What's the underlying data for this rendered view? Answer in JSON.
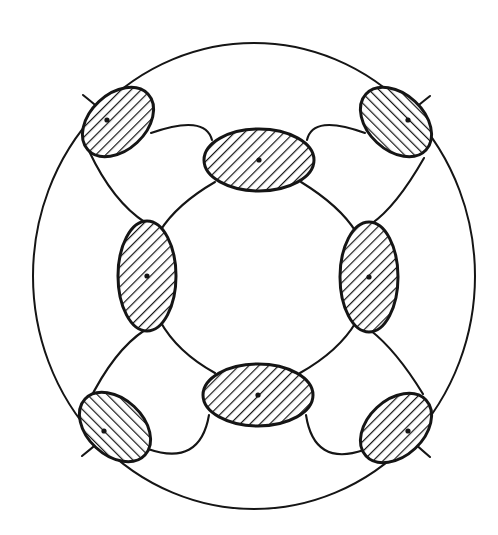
{
  "figure": {
    "background_color": "#ffffff",
    "line_color": "#151515",
    "hatch_color": "#151515",
    "fill_color": "#ffffff",
    "canvas": {
      "width": 498,
      "height": 535
    }
  },
  "chart_data": {
    "type": "diagram",
    "coordinate_system": "image pixels, origin top-left",
    "boundary": {
      "name": "outer-circle",
      "shape": "ellipse",
      "cx": 254,
      "cy": 276,
      "rx": 221,
      "ry": 233,
      "stroke_width": 2.0,
      "fill": "none"
    },
    "node_count": 8,
    "node_style": {
      "fill": "#ffffff",
      "stroke": "#151515",
      "stroke_width": 3.0,
      "hatch_pattern": "45-degree parallel lines",
      "hatch_spacing_px": 7,
      "hatch_line_width_px": 2.4,
      "center_marker": "small filled dot"
    },
    "nodes": [
      {
        "id": "node-top",
        "position": "top",
        "cx": 259,
        "cy": 160,
        "rx": 55,
        "ry": 31,
        "rotation_deg": 0,
        "hatch_angle_deg": 45,
        "dot": true
      },
      {
        "id": "node-right",
        "position": "right",
        "cx": 369,
        "cy": 277,
        "rx": 29,
        "ry": 55,
        "rotation_deg": 0,
        "hatch_angle_deg": 45,
        "dot": true
      },
      {
        "id": "node-bottom",
        "position": "bottom",
        "cx": 258,
        "cy": 395,
        "rx": 55,
        "ry": 31,
        "rotation_deg": 0,
        "hatch_angle_deg": 45,
        "dot": true
      },
      {
        "id": "node-left",
        "position": "left",
        "cx": 147,
        "cy": 276,
        "rx": 29,
        "ry": 55,
        "rotation_deg": 0,
        "hatch_angle_deg": 45,
        "dot": true
      },
      {
        "id": "node-top-left",
        "position": "top-left",
        "cx": 118,
        "cy": 122,
        "rx": 41,
        "ry": 28,
        "rotation_deg": -43,
        "hatch_angle_deg": 47,
        "dot": true
      },
      {
        "id": "node-top-right",
        "position": "top-right",
        "cx": 396,
        "cy": 122,
        "rx": 41,
        "ry": 28,
        "rotation_deg": 43,
        "hatch_angle_deg": -47,
        "dot": true
      },
      {
        "id": "node-bottom-left",
        "position": "bottom-left",
        "cx": 115,
        "cy": 427,
        "rx": 41,
        "ry": 28,
        "rotation_deg": 43,
        "hatch_angle_deg": -47,
        "dot": true
      },
      {
        "id": "node-bottom-right",
        "position": "bottom-right",
        "cx": 396,
        "cy": 428,
        "rx": 41,
        "ry": 28,
        "rotation_deg": -43,
        "hatch_angle_deg": 47,
        "dot": true
      }
    ],
    "connector_count": 16,
    "connector_style": {
      "stroke": "#151515",
      "stroke_width": 2.0,
      "fill": "none",
      "curvature": "gentle outward bow"
    },
    "connectors": [
      {
        "id": "arc-outer-tl-top",
        "ring": "outer",
        "from": "node-top-left",
        "to": "node-top",
        "path": "M 152 138 Q 205 118 210 142"
      },
      {
        "id": "arc-outer-top-tr",
        "ring": "outer",
        "from": "node-top",
        "to": "node-top-right",
        "path": "M 308 142 Q 315 118 363 137"
      },
      {
        "id": "arc-outer-tr-right",
        "ring": "outer",
        "from": "node-top-right",
        "to": "node-right",
        "path": "M 420 158 Q 394 205 368 222"
      },
      {
        "id": "arc-outer-right-br",
        "ring": "outer",
        "from": "node-right",
        "to": "node-bottom-right",
        "path": "M 369 332 Q 395 352 419 392"
      },
      {
        "id": "arc-outer-br-bottom",
        "ring": "outer",
        "from": "node-bottom-right",
        "to": "node-bottom",
        "path": "M 362 447 Q 315 470 308 413"
      },
      {
        "id": "arc-outer-bottom-bl",
        "ring": "outer",
        "from": "node-bottom",
        "to": "node-bottom-left",
        "path": "M 208 413 Q 200 470 150 446"
      },
      {
        "id": "arc-outer-bl-left",
        "ring": "outer",
        "from": "node-bottom-left",
        "to": "node-left",
        "path": "M 93 406 Q 115 350 147 331"
      },
      {
        "id": "arc-outer-left-tl",
        "ring": "outer",
        "from": "node-left",
        "to": "node-top-left",
        "path": "M 147 222 Q 113 200 92 148"
      },
      {
        "id": "arc-inner-top-right",
        "ring": "inner",
        "from": "node-top",
        "to": "node-right",
        "path": "M 300 184 Q 338 205 354 233"
      },
      {
        "id": "arc-inner-right-bottom",
        "ring": "inner",
        "from": "node-right",
        "to": "node-bottom",
        "path": "M 354 320 Q 337 350 300 371"
      },
      {
        "id": "arc-inner-bottom-left",
        "ring": "inner",
        "from": "node-bottom",
        "to": "node-left",
        "path": "M 216 371 Q 178 351 161 320"
      },
      {
        "id": "arc-inner-left-top",
        "ring": "inner",
        "from": "node-left",
        "to": "node-top",
        "path": "M 161 232 Q 178 204 216 184"
      },
      {
        "id": "arc-spoke-tl",
        "ring": "spoke",
        "from": "node-top-left",
        "to": "node-left",
        "path": "M 152 138 Q 176 158 213 143"
      },
      {
        "id": "arc-spoke-tr",
        "ring": "spoke",
        "from": "node-top-right",
        "to": "node-right",
        "path": "M 363 137 Q 384 157 420 158"
      },
      {
        "id": "arc-spoke-bl",
        "ring": "spoke",
        "from": "node-bottom-left",
        "to": "node-bottom",
        "path": "M 93 406 Q 122 420 150 446"
      },
      {
        "id": "arc-spoke-br",
        "ring": "spoke",
        "from": "node-bottom-right",
        "to": "node-right",
        "path": "M 419 392 Q 404 418 396 400"
      }
    ],
    "symmetry": "4-fold rotational (C4) about the circle centre",
    "labels": [],
    "annotations": []
  }
}
